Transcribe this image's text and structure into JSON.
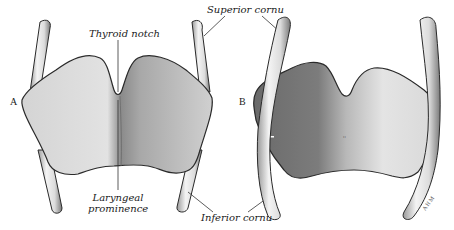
{
  "figure": {
    "panels": [
      {
        "letter": "A",
        "view": "anterior"
      },
      {
        "letter": "B",
        "view": "posterior"
      }
    ],
    "labels": {
      "thyroid_notch": "Thyroid notch",
      "superior_cornu": "Superior cornu",
      "laryngeal_prominence_line1": "Laryngeal",
      "laryngeal_prominence_line2": "prominence",
      "inferior_cornu": "Inferior cornu"
    },
    "signature": "AHM",
    "colors": {
      "background": "#ffffff",
      "cartilage_light": "#e6e6e6",
      "cartilage_mid": "#bdbdbd",
      "cartilage_dark": "#6e6e6e",
      "outline": "#2a2a2a",
      "leader_line": "#333333"
    }
  }
}
